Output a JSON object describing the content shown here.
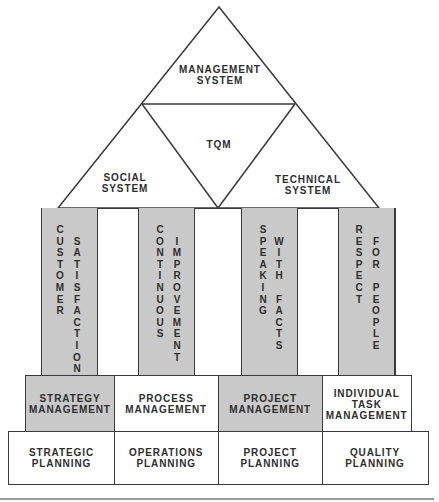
{
  "diagram": {
    "roof": {
      "top": {
        "label": "MANAGEMENT\nSYSTEM"
      },
      "center": {
        "label": "TQM"
      },
      "left": {
        "label": "SOCIAL\nSYSTEM"
      },
      "right": {
        "label": "TECHNICAL\nSYSTEM"
      }
    },
    "pillars": [
      {
        "label": "CUSTOMER SATISFACTION",
        "col1": "CUSTOMER",
        "col2": "SATISFACTION",
        "shaded": true
      },
      {
        "label": "CONTINUOUS IMPROVEMENT",
        "col1": "CONTINUOUS",
        "col2": "IMPROVEMENT",
        "shaded": true
      },
      {
        "label": "SPEAKING WITH FACTS",
        "col1": "SPEAKING",
        "col2": "WITH FACTS",
        "shaded": true
      },
      {
        "label": "RESPECT FOR PEOPLE",
        "col1": "RESPECT",
        "col2": "FOR PEOPLE",
        "shaded": true
      }
    ],
    "management_row": [
      {
        "label": "STRATEGY\nMANAGEMENT",
        "shaded": true
      },
      {
        "label": "PROCESS\nMANAGEMENT",
        "shaded": false
      },
      {
        "label": "PROJECT\nMANAGEMENT",
        "shaded": true
      },
      {
        "label": "INDIVIDUAL\nTASK\nMANAGEMENT",
        "shaded": false
      }
    ],
    "planning_row": [
      {
        "label": "STRATEGIC\nPLANNING"
      },
      {
        "label": "OPERATIONS\nPLANNING"
      },
      {
        "label": "PROJECT\nPLANNING"
      },
      {
        "label": "QUALITY\nPLANNING"
      }
    ],
    "colors": {
      "line": "#3a3a3a",
      "shade": "#c9c9c9",
      "background": "#ffffff",
      "rule": "#9a9a9a"
    }
  }
}
